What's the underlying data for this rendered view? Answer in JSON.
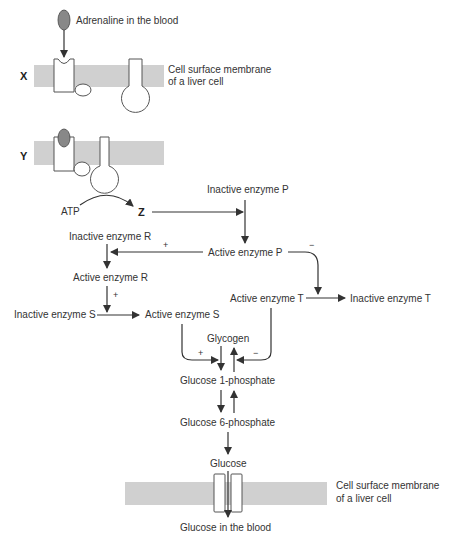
{
  "diagram": {
    "labels": {
      "X": "X",
      "Y": "Y",
      "Z": "Z",
      "adrenaline": "Adrenaline in the blood",
      "membrane_top_1": "Cell surface membrane",
      "membrane_top_2": "of a liver cell",
      "membrane_bottom_1": "Cell surface membrane",
      "membrane_bottom_2": "of a liver cell",
      "atp": "ATP",
      "inactive_p": "Inactive enzyme P",
      "active_p": "Active enzyme P",
      "inactive_r": "Inactive enzyme R",
      "active_r": "Active enzyme R",
      "inactive_s": "Inactive enzyme S",
      "active_s": "Active enzyme S",
      "active_t": "Active enzyme T",
      "inactive_t": "Inactive enzyme T",
      "glycogen": "Glycogen",
      "g1p": "Glucose 1-phosphate",
      "g6p": "Glucose 6-phosphate",
      "glucose": "Glucose",
      "glucose_blood": "Glucose in the blood"
    },
    "signs": {
      "p_to_r": "+",
      "p_to_t": "−",
      "r_to_s": "+",
      "s_to_glycogen": "+",
      "t_to_glycogen": "−"
    },
    "colors": {
      "membrane": "#d0d0d0",
      "adrenaline": "#888888",
      "line": "#333333"
    }
  }
}
